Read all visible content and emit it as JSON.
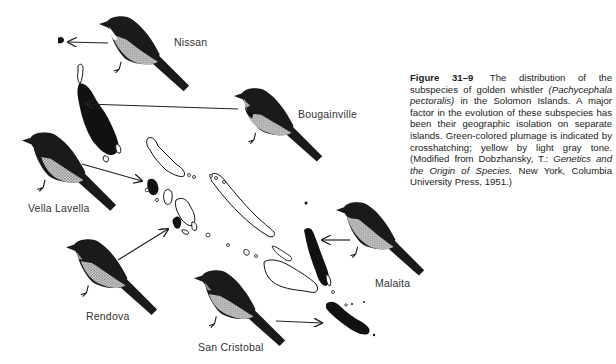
{
  "figure": {
    "number": "Figure 31–9",
    "caption_parts": {
      "p1": "The distribution of the subspecies of golden whistler ",
      "species": "(Pachycephala pectoralis)",
      "p2": " in the Solomon Islands. A major factor in the evolution of these subspecies has been their geographic isolation on separate islands. Green-colored plumage is indicated by crosshatching; yellow by light gray tone. (Modified from Dobzhansky, T.: ",
      "book": "Genetics and the Origin of Species.",
      "p3": " New York, Columbia University Press, 1951.)"
    }
  },
  "labels": {
    "nissan": "Nissan",
    "bougainville": "Bougainville",
    "vella_lavella": "Vella Lavella",
    "rendova": "Rendova",
    "san_cristobal": "San Cristobal",
    "malaita": "Malaita"
  },
  "colors": {
    "ink": "#1a1a1a",
    "shade": "#9a9a9a",
    "light_shade": "#c8c8c8",
    "background": "#ffffff"
  }
}
